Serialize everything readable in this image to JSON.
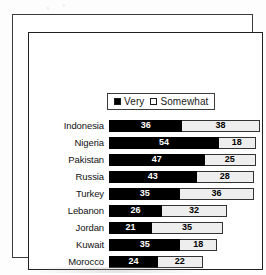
{
  "chart_data": {
    "type": "bar",
    "subtype": "horizontal-stacked",
    "title": "",
    "xlabel": "",
    "ylabel": "",
    "grid": false,
    "legend_position": "top-center",
    "axis_max": 80,
    "categories": [
      "Indonesia",
      "Nigeria",
      "Pakistan",
      "Russia",
      "Turkey",
      "Lebanon",
      "Jordan",
      "Kuwait",
      "Morocco"
    ],
    "series": [
      {
        "name": "Very",
        "color": "#000000",
        "marker": "filled-square",
        "values": [
          36,
          54,
          47,
          43,
          35,
          26,
          21,
          35,
          24
        ]
      },
      {
        "name": "Somewhat",
        "color": "#eeeeee",
        "marker": "hollow-square",
        "values": [
          38,
          18,
          25,
          28,
          36,
          32,
          35,
          18,
          22
        ]
      }
    ],
    "rows": [
      {
        "label": "Indonesia",
        "very": 36,
        "somewhat": 38
      },
      {
        "label": "Nigeria",
        "very": 54,
        "somewhat": 18
      },
      {
        "label": "Pakistan",
        "very": 47,
        "somewhat": 25
      },
      {
        "label": "Russia",
        "very": 43,
        "somewhat": 28
      },
      {
        "label": "Turkey",
        "very": 35,
        "somewhat": 36
      },
      {
        "label": "Lebanon",
        "very": 26,
        "somewhat": 32
      },
      {
        "label": "Jordan",
        "very": 21,
        "somewhat": 35
      },
      {
        "label": "Kuwait",
        "very": 35,
        "somewhat": 18
      },
      {
        "label": "Morocco",
        "very": 24,
        "somewhat": 22
      }
    ]
  },
  "legend": {
    "items": [
      {
        "label": "Very",
        "swatch": "filled-square"
      },
      {
        "label": "Somewhat",
        "swatch": "hollow-square"
      }
    ]
  }
}
